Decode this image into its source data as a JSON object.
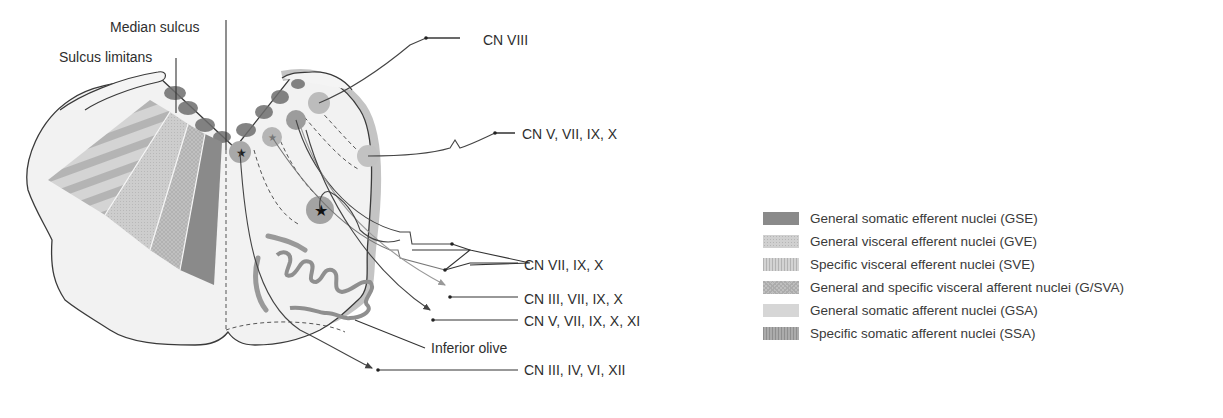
{
  "figure": {
    "labels": {
      "median_sulcus": "Median sulcus",
      "sulcus_limitans": "Sulcus limitans",
      "cn_viii": "CN VIII",
      "cn_v_vii_ix_x": "CN V, VII, IX, X",
      "cn_vii_ix_x": "CN VII, IX, X",
      "cn_iii_vii_ix_x": "CN III, VII, IX, X",
      "cn_v_vii_ix_x_xi": "CN V, VII, IX, X, XI",
      "inferior_olive": "Inferior olive",
      "cn_iii_iv_vi_xii": "CN III, IV, VI, XII"
    }
  },
  "legend": {
    "items": [
      {
        "label": "General somatic efferent nuclei (GSE)",
        "color": "#8a8a8a",
        "pattern": "solid"
      },
      {
        "label": "General visceral efferent nuclei (GVE)",
        "color": "#cfcfcf",
        "pattern": "dots"
      },
      {
        "label": "Specific visceral efferent nuclei (SVE)",
        "color": "#c9c9c9",
        "pattern": "vertical-stripes"
      },
      {
        "label": "General and specific visceral afferent nuclei (G/SVA)",
        "color": "#bdbdbd",
        "pattern": "crosshatch"
      },
      {
        "label": "General somatic afferent nuclei (GSA)",
        "color": "#d6d6d6",
        "pattern": "solid"
      },
      {
        "label": "Specific somatic afferent nuclei (SSA)",
        "color": "#a9a9a9",
        "pattern": "vertical-stripes"
      }
    ]
  }
}
